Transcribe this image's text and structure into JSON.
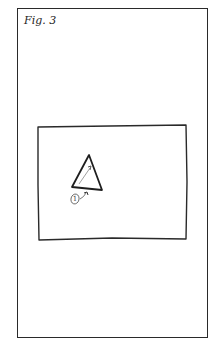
{
  "figure": {
    "label": "Fig. 3",
    "marker": "1"
  },
  "colors": {
    "ink": "#2a2a2a",
    "pencil": "#555555",
    "background": "#ffffff"
  }
}
